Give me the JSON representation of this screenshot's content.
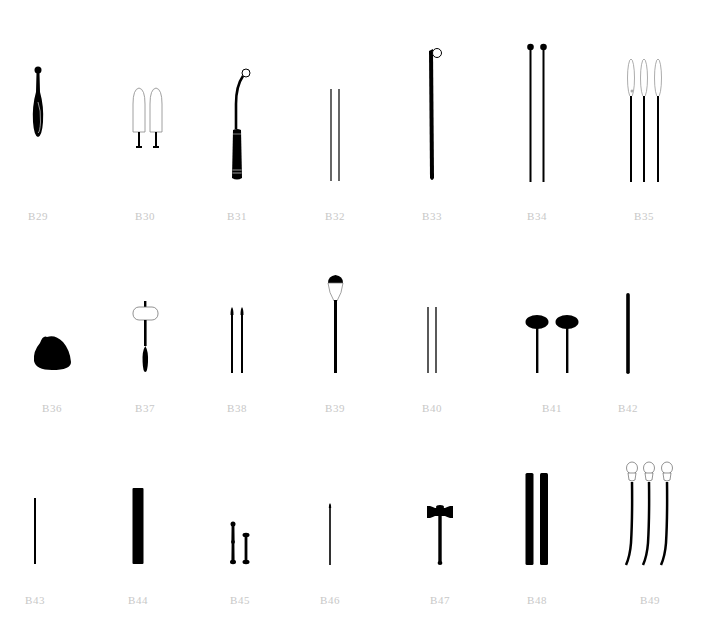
{
  "figure": {
    "background": "#ffffff",
    "ink_color": "#000000",
    "label_color": "#c8c8c8",
    "items": [
      {
        "id": "B29",
        "label": "B29",
        "icon": "tapered-handle-icon"
      },
      {
        "id": "B30",
        "label": "B30",
        "icon": "pair-of-outlined-paddles-icon"
      },
      {
        "id": "B31",
        "label": "B31",
        "icon": "curved-hook-handle-icon"
      },
      {
        "id": "B32",
        "label": "B32",
        "icon": "pair-of-thin-rods-icon"
      },
      {
        "id": "B33",
        "label": "B33",
        "icon": "stick-with-loop-icon"
      },
      {
        "id": "B34",
        "label": "B34",
        "icon": "pair-of-knobbed-sticks-icon"
      },
      {
        "id": "B35",
        "label": "B35",
        "icon": "three-needle-sticks-icon"
      },
      {
        "id": "B36",
        "label": "B36",
        "icon": "rounded-stone-icon"
      },
      {
        "id": "B37",
        "label": "B37",
        "icon": "mallet-outlined-head-icon"
      },
      {
        "id": "B38",
        "label": "B38",
        "icon": "pair-of-pointed-rods-icon"
      },
      {
        "id": "B39",
        "label": "B39",
        "icon": "soft-head-beater-icon"
      },
      {
        "id": "B40",
        "label": "B40",
        "icon": "pair-of-thin-rods-icon"
      },
      {
        "id": "B41",
        "label": "B41",
        "icon": "pair-of-oval-mallets-icon"
      },
      {
        "id": "B42",
        "label": "B42",
        "icon": "single-thick-rod-icon"
      },
      {
        "id": "B43",
        "label": "B43",
        "icon": "single-thin-rod-icon"
      },
      {
        "id": "B44",
        "label": "B44",
        "icon": "wide-bar-icon"
      },
      {
        "id": "B45",
        "label": "B45",
        "icon": "pair-of-short-bones-icon"
      },
      {
        "id": "B46",
        "label": "B46",
        "icon": "thin-pointed-rod-icon"
      },
      {
        "id": "B47",
        "label": "B47",
        "icon": "gavel-hammer-icon"
      },
      {
        "id": "B48",
        "label": "B48",
        "icon": "pair-of-wide-bars-icon"
      },
      {
        "id": "B49",
        "label": "B49",
        "icon": "three-curved-beaters-icon"
      }
    ]
  }
}
